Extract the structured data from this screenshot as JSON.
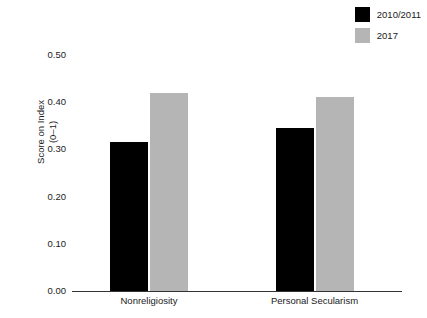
{
  "chart_data": {
    "type": "bar",
    "title": "",
    "subtitle": "",
    "xlabel": "",
    "ylabel": "Score on Index",
    "ylabel_line2": "(0–1)",
    "categories": [
      "Nonreligiosity",
      "Personal Secularism"
    ],
    "series": [
      {
        "name": "2010/2011",
        "color": "#000000",
        "values": [
          0.315,
          0.345
        ]
      },
      {
        "name": "2017",
        "color": "#b5b5b5",
        "values": [
          0.42,
          0.41
        ]
      }
    ],
    "ylim": [
      0.0,
      0.5
    ],
    "yticks": [
      "0.00",
      "0.10",
      "0.20",
      "0.30",
      "0.40",
      "0.50"
    ],
    "ytick_values": [
      0.0,
      0.1,
      0.2,
      0.3,
      0.4,
      0.5
    ],
    "grid": false,
    "legend_position": "top-right",
    "annotations": []
  },
  "legend": {
    "items": [
      {
        "label": "2010/2011",
        "color": "#000000"
      },
      {
        "label": "2017",
        "color": "#b5b5b5"
      }
    ]
  },
  "axes": {
    "y_title_line1": "Score on Index",
    "y_title_line2": "(0–1)",
    "y_tick_labels": [
      "0.50",
      "0.40",
      "0.30",
      "0.20",
      "0.10",
      "0.00"
    ],
    "x_tick_labels": [
      "Nonreligiosity",
      "Personal Secularism"
    ]
  },
  "colors": {
    "series_1": "#000000",
    "series_2": "#b5b5b5",
    "axis": "#333333",
    "text": "#1a1a1a",
    "background": "#ffffff"
  }
}
